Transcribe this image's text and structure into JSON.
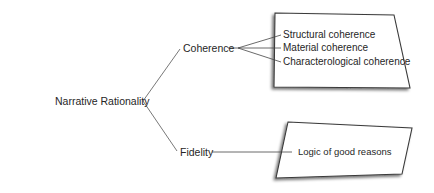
{
  "diagram": {
    "root": {
      "label": "Narrative Rationality"
    },
    "branches": [
      {
        "label": "Coherence",
        "children": [
          {
            "label": "Structural coherence"
          },
          {
            "label": "Material coherence"
          },
          {
            "label": "Characterological coherence"
          }
        ]
      },
      {
        "label": "Fidelity",
        "children": [
          {
            "label": "Logic of good reasons"
          }
        ]
      }
    ]
  }
}
